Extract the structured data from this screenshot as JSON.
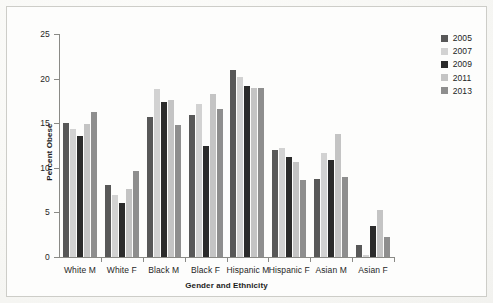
{
  "chart_data": {
    "type": "bar",
    "title": "",
    "xlabel": "Gender and Ethnicity",
    "ylabel": "Percent Obese",
    "ylim": [
      0,
      25
    ],
    "yticks": [
      0,
      5,
      10,
      15,
      20,
      25
    ],
    "grid": false,
    "legend_position": "top-right",
    "categories": [
      "White M",
      "White F",
      "Black M",
      "Black F",
      "Hispanic M",
      "Hispanic F",
      "Asian M",
      "Asian F"
    ],
    "series": [
      {
        "name": "2005",
        "color": "#585858",
        "values": [
          15.0,
          8.1,
          15.7,
          15.9,
          21.0,
          12.0,
          8.8,
          1.4
        ]
      },
      {
        "name": "2007",
        "color": "#d2d2d2",
        "values": [
          14.3,
          7.0,
          18.8,
          17.1,
          20.2,
          12.2,
          11.7,
          0.2
        ]
      },
      {
        "name": "2009",
        "color": "#2b2b2b",
        "values": [
          13.6,
          6.1,
          17.4,
          12.5,
          19.2,
          11.2,
          10.9,
          3.5
        ]
      },
      {
        "name": "2011",
        "color": "#c4c4c4",
        "values": [
          14.9,
          7.6,
          17.6,
          18.3,
          19.0,
          10.7,
          13.8,
          5.3
        ]
      },
      {
        "name": "2013",
        "color": "#8e8e8e",
        "values": [
          16.3,
          9.6,
          14.8,
          16.6,
          19.0,
          8.6,
          9.0,
          2.2
        ]
      }
    ]
  },
  "legend": {
    "items": [
      {
        "label": "2005"
      },
      {
        "label": "2007"
      },
      {
        "label": "2009"
      },
      {
        "label": "2011"
      },
      {
        "label": "2013"
      }
    ]
  }
}
